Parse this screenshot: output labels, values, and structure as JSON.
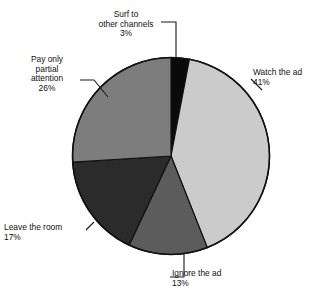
{
  "chart_data": {
    "type": "pie",
    "title": "",
    "xlabel": "",
    "ylabel": "",
    "legend_position": "none",
    "grid": false,
    "unit": "%",
    "total": 100,
    "start_angle_deg": 0,
    "direction": "clockwise",
    "categories": [
      "Surf to other channels",
      "Watch the ad",
      "Ignore the ad",
      "Leave the room",
      "Pay only partial attention"
    ],
    "values": [
      3,
      41,
      13,
      17,
      26
    ],
    "colors": [
      "#0a0a0a",
      "#cbcbcb",
      "#5c5c5c",
      "#2b2b2b",
      "#7d7d7d"
    ],
    "slices": [
      {
        "name": "surf-to-other-channels",
        "label_lines": "Surf to\nother channels\n3%",
        "label_text": "Surf to other channels",
        "value": 3,
        "value_text": "3%",
        "color": "#0a0a0a"
      },
      {
        "name": "watch-the-ad",
        "label_lines": "Watch the ad\n41%",
        "label_text": "Watch the ad",
        "value": 41,
        "value_text": "41%",
        "color": "#cbcbcb"
      },
      {
        "name": "ignore-the-ad",
        "label_lines": "Ignore the ad\n13%",
        "label_text": "Ignore the ad",
        "value": 13,
        "value_text": "13%",
        "color": "#5c5c5c"
      },
      {
        "name": "leave-the-room",
        "label_lines": "Leave the room\n17%",
        "label_text": "Leave the room",
        "value": 17,
        "value_text": "17%",
        "color": "#2b2b2b"
      },
      {
        "name": "pay-only-partial-attention",
        "label_lines": "Pay only\npartial\nattention\n26%",
        "label_text": "Pay only partial attention",
        "value": 26,
        "value_text": "26%",
        "color": "#7d7d7d"
      }
    ]
  },
  "figure": {
    "outline_color": "#111111",
    "leader_color": "#1a1a1a",
    "background": "#ffffff"
  }
}
